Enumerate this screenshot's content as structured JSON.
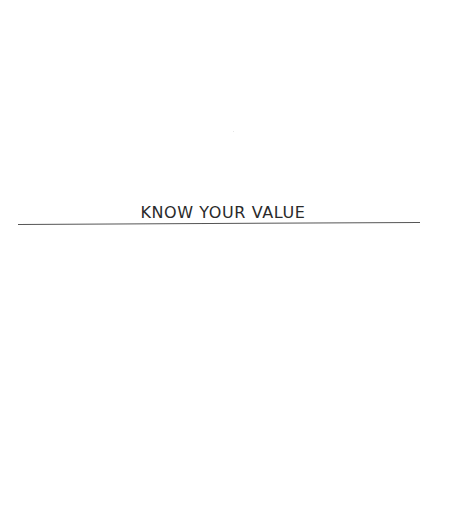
{
  "document": {
    "section_heading": "KNOW YOUR VALUE",
    "colors": {
      "background": "#ffffff",
      "heading_text": "#2a2a2a",
      "rule": "#555555"
    }
  }
}
